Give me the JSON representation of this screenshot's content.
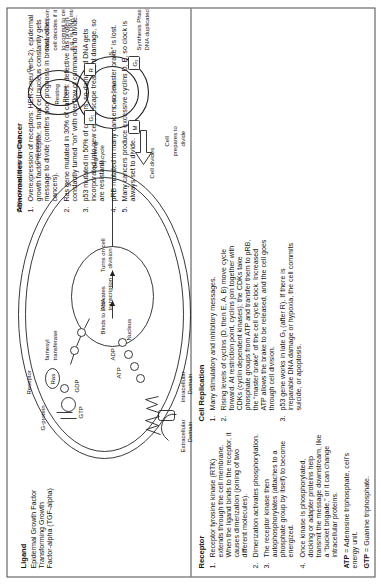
{
  "document": {
    "title": "Cell Signaling and the Cell Cycle — Abnormalities in Cancer"
  },
  "abnormalities": {
    "heading": "Abnormalities in Cancer",
    "items": [
      {
        "n": "1.",
        "text": "Overexpression of receptors: HER-2-neu (erb-2), epidermal growth factor receptor, so that cell nucleus constantly gets message to divide (confers poor prognosis in breast, other cancers)."
      },
      {
        "n": "2.",
        "text": "Ras gene mutated in 30% of cancers: defective ras protein constantly turned “on” with overflow of commands to divide."
      },
      {
        "n": "3.",
        "text": "p53 mutated in 50% of cancers, so damaged DNA gets incorporated into new cells (escape treatment damage, so are resistant)."
      },
      {
        "n": "4.",
        "text": "pRB mutated in many cancers, so “master brake” is lost."
      },
      {
        "n": "5.",
        "text": "Many cancers produce excessive cyclins D, E, so clock is always set to divide."
      }
    ]
  },
  "ligand": {
    "heading": "Ligand",
    "lines": [
      "Epidermal Growth Factor",
      "Transforming Growth",
      "Factor-alpha (TGF-alpha)"
    ]
  },
  "receptor": {
    "heading": "Receptor",
    "items": [
      {
        "n": "1.",
        "text": "Receptor tyrosine kinase (RTK) extends through the cell membrane. When the ligand binds to the receptor, it causes dimerization (joining of two different molecules)."
      },
      {
        "n": "2.",
        "text": "Dimerization activates phosphorylation."
      },
      {
        "n": "3.",
        "text": "The receptor kinase then autophosphorylates (attaches to a phosphate group by itself) to become energized."
      },
      {
        "n": "4.",
        "text": "Once kinase is phosphorylated, docking or adapter proteins help transmit the message downstream, like a “bucket brigade,” or it can change intracellular proteins."
      }
    ],
    "definitions": [
      {
        "term": "ATP",
        "text": " = Adenosine triphosphate, cell’s energy unit."
      },
      {
        "term": "GTP",
        "text": " = Guanine triphosphate."
      }
    ]
  },
  "cell_replication": {
    "heading": "Cell Replication",
    "items": [
      {
        "n": "1.",
        "text": "Many stimulatory and inhibitory messages."
      },
      {
        "n": "2.",
        "text": "Rising levels of cyclins (D, then E, A, B) move cycle forward. At restriction point, cyclins join together with CDKs (cyclin dependent kinases); the CDKs take phosphate groups from ATP and transfer them to pRB, the “master brake” of the cell cycle clock. Increased ATP allows the brake to be released, and the cell goes through cell division."
      },
      {
        "n": "3.",
        "text": "p53 gene works in late G₁ (after R). If there is irreparable DNA damage or hypoxia, the cell commits suicide, or apoptosis."
      }
    ]
  },
  "diagram": {
    "labels": {
      "g_protein": "G-protein",
      "receptor": "Receptor",
      "ras": "Ras",
      "gtp": "GTP",
      "gdp": "GDP",
      "farnesyl": "farnesyl\ntransferase",
      "farnesyl_line1": "farnesyl",
      "farnesyl_line2": "transferase",
      "extracellular_line1": "Extracellular",
      "extracellular_line2": "Domain",
      "intracellular_line1": "Intracellular",
      "intracellular_line2": "Domain",
      "nucleus": "Nucleus",
      "binds_to_dna": "Binds to DNA",
      "activates_transcription_l1": "Activates",
      "activates_transcription_l2": "transcription",
      "turns_on_l1": "Turns on cell",
      "turns_on_l2": "division",
      "atp": "ATP",
      "adp": "ADP",
      "p": "P",
      "cell_cycle": "Cell cycle",
      "beginning_l1": "Beginning",
      "beginning_l2": "of cycle",
      "cell_enters": "Cell enters",
      "resting_l1": "Resting",
      "resting_l2": "Phase",
      "g0": "G₀",
      "g1": "G₁",
      "g2": "G₂",
      "s": "S",
      "m": "M",
      "r": "R",
      "cell_divides": "Cell divides",
      "cell_prepares_l1": "Cell",
      "cell_prepares_l2": "prepares to",
      "cell_prepares_l3": "divide",
      "cell_enlarges": "Cell enlarges, making protein",
      "restriction_l1": "Restriction point:",
      "restriction_l2": "cell decides if it is alright to commit to cell",
      "restriction_l3": "division, e.g., is DNA intact or damaged?",
      "synthesis_l1": "Synthesis Phase:",
      "synthesis_l2": "DNA duplicated"
    }
  },
  "colors": {
    "ink": "#161616",
    "line": "#4a4a4a",
    "paper": "#ffffff",
    "margin": "#fbfbfa"
  }
}
